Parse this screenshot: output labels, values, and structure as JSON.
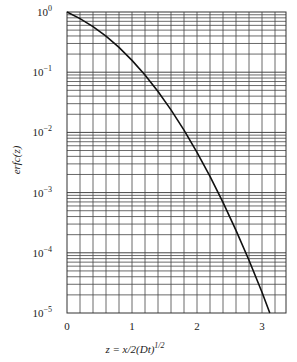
{
  "chart_data": {
    "type": "line",
    "title": "",
    "xlabel": "z = x/2(Dt)^1/2",
    "ylabel": "erfc(z)",
    "xlim": [
      0,
      3.35
    ],
    "ylim": [
      1e-05,
      1
    ],
    "yscale": "log",
    "grid": true,
    "x_ticks": [
      "0",
      "1",
      "2",
      "3"
    ],
    "y_ticks": [
      "10^0",
      "10^-1",
      "10^-2",
      "10^-3",
      "10^-4",
      "10^-5"
    ],
    "series": [
      {
        "name": "erfc(z)",
        "x": [
          0,
          0.2,
          0.4,
          0.6,
          0.8,
          1.0,
          1.2,
          1.4,
          1.6,
          1.8,
          2.0,
          2.2,
          2.4,
          2.6,
          2.8,
          3.0,
          3.12
        ],
        "values": [
          1.0,
          0.7773,
          0.5716,
          0.3961,
          0.2579,
          0.1573,
          0.0897,
          0.0477,
          0.02365,
          0.01091,
          0.004678,
          0.001863,
          0.000689,
          0.000236,
          7.5e-05,
          2.21e-05,
          1e-05
        ]
      }
    ]
  },
  "axes": {
    "xlabel_main": "z = x/2(Dt)",
    "xlabel_exp": "1/2",
    "ylabel": "erfc(z)",
    "x_ticks": [
      "0",
      "1",
      "2",
      "3"
    ],
    "y_ticks": [
      {
        "base": "10",
        "exp": "0"
      },
      {
        "base": "10",
        "exp": "−1"
      },
      {
        "base": "10",
        "exp": "−2"
      },
      {
        "base": "10",
        "exp": "−3"
      },
      {
        "base": "10",
        "exp": "−4"
      },
      {
        "base": "10",
        "exp": "−5"
      }
    ]
  }
}
